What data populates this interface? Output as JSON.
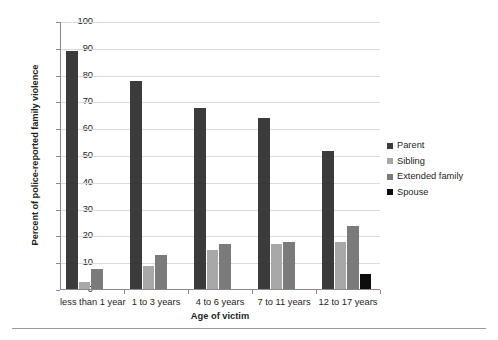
{
  "chart_data": {
    "type": "bar",
    "title": "",
    "subtitle": "",
    "xlabel": "Age of victim",
    "ylabel": "Percent of police-reported family violence",
    "ylim": [
      0,
      100
    ],
    "ytick_step": 10,
    "ytick_labels": [
      "0",
      "10",
      "20",
      "30",
      "40",
      "50",
      "60",
      "70",
      "80",
      "90",
      "100"
    ],
    "grid": true,
    "grid_axis": "y",
    "legend_position": "right",
    "categories": [
      "less than 1 year",
      "1 to 3 years",
      "4 to 6 years",
      "7 to 11 years",
      "12 to 17 years"
    ],
    "series": [
      {
        "name": "Parent",
        "color": "#3b3b3b",
        "values": [
          89,
          78,
          68,
          64,
          52
        ]
      },
      {
        "name": "Sibling",
        "color": "#a8a8a8",
        "values": [
          3,
          9,
          15,
          17,
          18
        ]
      },
      {
        "name": "Extended family",
        "color": "#7b7b7b",
        "values": [
          8,
          13,
          17,
          18,
          24
        ]
      },
      {
        "name": "Spouse",
        "color": "#0d0d0d",
        "values": [
          0,
          0,
          0,
          0,
          6
        ]
      }
    ]
  },
  "legend": {
    "items": [
      {
        "label": "Parent",
        "color": "#3b3b3b"
      },
      {
        "label": "Sibling",
        "color": "#a8a8a8"
      },
      {
        "label": "Extended family",
        "color": "#7b7b7b"
      },
      {
        "label": "Spouse",
        "color": "#0d0d0d"
      }
    ]
  }
}
